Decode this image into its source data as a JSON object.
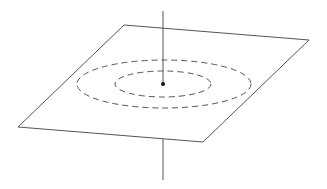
{
  "diagram": {
    "colors": {
      "background": "#ffffff",
      "stroke": "#555555",
      "dot": "#111111"
    },
    "plane": {
      "points": "124,25 309,40 203,142 18,127"
    },
    "axis_upper": {
      "x1": 163,
      "y1": 11,
      "x2": 163,
      "y2": 84
    },
    "axis_lower": {
      "x1": 163,
      "y1": 139,
      "x2": 163,
      "y2": 180
    },
    "outer_circle": {
      "cx": 164,
      "cy": 84,
      "rx": 87,
      "ry": 24
    },
    "inner_circle": {
      "cx": 163,
      "cy": 84,
      "rx": 48,
      "ry": 13
    },
    "point": {
      "cx": 163,
      "cy": 84,
      "r": 2
    }
  }
}
